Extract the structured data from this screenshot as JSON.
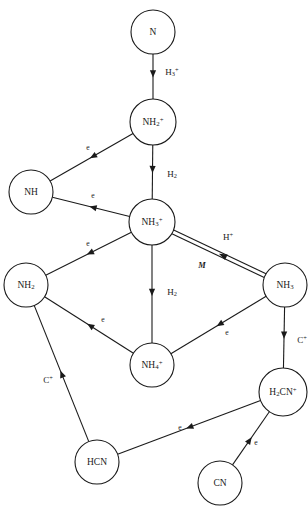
{
  "diagram": {
    "type": "reaction-network",
    "title": "",
    "nodes": [
      {
        "id": "N",
        "label": "N",
        "base": "N",
        "sub": "",
        "sup": "",
        "cx": 153,
        "cy": 32,
        "r": 22
      },
      {
        "id": "NH2p",
        "label": "NH2+",
        "base": "NH",
        "sub": "2",
        "sup": "+",
        "cx": 153,
        "cy": 122,
        "r": 23
      },
      {
        "id": "NH",
        "label": "NH",
        "base": "NH",
        "sub": "",
        "sup": "",
        "cx": 31,
        "cy": 192,
        "r": 22
      },
      {
        "id": "NH3p",
        "label": "NH3+",
        "base": "NH",
        "sub": "3",
        "sup": "+",
        "cx": 152,
        "cy": 222,
        "r": 23
      },
      {
        "id": "NH2",
        "label": "NH2",
        "base": "NH",
        "sub": "2",
        "sup": "",
        "cx": 26,
        "cy": 285,
        "r": 22
      },
      {
        "id": "NH3",
        "label": "NH3",
        "base": "NH",
        "sub": "3",
        "sup": "",
        "cx": 285,
        "cy": 285,
        "r": 22
      },
      {
        "id": "NH4p",
        "label": "NH4+",
        "base": "NH",
        "sub": "4",
        "sup": "+",
        "cx": 152,
        "cy": 365,
        "r": 22
      },
      {
        "id": "H2CNp",
        "label": "H2CN+",
        "base": "",
        "sub": "",
        "sup": "",
        "cx": 283,
        "cy": 392,
        "r": 24
      },
      {
        "id": "HCN",
        "label": "HCN",
        "base": "HCN",
        "sub": "",
        "sup": "",
        "cx": 97,
        "cy": 462,
        "r": 22
      },
      {
        "id": "CN",
        "label": "CN",
        "base": "CN",
        "sub": "",
        "sup": "",
        "cx": 220,
        "cy": 483,
        "r": 22
      }
    ],
    "edges": [
      {
        "id": "e1",
        "from": "N",
        "to": "NH2p",
        "label": "H3+",
        "base": "H",
        "sub": "3",
        "sup": "+",
        "style": "single",
        "lx": 172,
        "ly": 73
      },
      {
        "id": "e2",
        "from": "NH2p",
        "to": "NH",
        "label": "e",
        "base": "e",
        "sub": "",
        "sup": "",
        "style": "single",
        "lx": 88,
        "ly": 148
      },
      {
        "id": "e3",
        "from": "NH2p",
        "to": "NH3p",
        "label": "H2",
        "base": "H",
        "sub": "2",
        "sup": "",
        "style": "single",
        "lx": 172,
        "ly": 175
      },
      {
        "id": "e4",
        "from": "NH3p",
        "to": "NH",
        "label": "e",
        "base": "e",
        "sub": "",
        "sup": "",
        "style": "single",
        "lx": 93,
        "ly": 196
      },
      {
        "id": "e5",
        "from": "NH3p",
        "to": "NH2",
        "label": "e",
        "base": "e",
        "sub": "",
        "sup": "",
        "style": "single",
        "lx": 88,
        "ly": 244
      },
      {
        "id": "e6",
        "from": "NH3p",
        "to": "NH4p",
        "label": "H2",
        "base": "H",
        "sub": "2",
        "sup": "",
        "style": "single",
        "lx": 172,
        "ly": 293
      },
      {
        "id": "e7",
        "from": "NH3",
        "to": "NH3p",
        "label": "H+",
        "base": "H",
        "sub": "",
        "sup": "+",
        "style": "double",
        "lx": 228,
        "ly": 238
      },
      {
        "id": "e8",
        "from": "NH3",
        "to": "NH3p",
        "label": "M",
        "base": "M",
        "sub": "",
        "sup": "",
        "style": "catalyst",
        "lx": 202,
        "ly": 266
      },
      {
        "id": "e9",
        "from": "NH4p",
        "to": "NH2",
        "label": "e",
        "base": "e",
        "sub": "",
        "sup": "",
        "style": "single",
        "lx": 103,
        "ly": 320
      },
      {
        "id": "e10",
        "from": "NH3",
        "to": "NH4p",
        "label": "e",
        "base": "e",
        "sub": "",
        "sup": "",
        "style": "single",
        "lx": 227,
        "ly": 333
      },
      {
        "id": "e11",
        "from": "NH3",
        "to": "H2CNp",
        "label": "C+",
        "base": "C",
        "sub": "",
        "sup": "+",
        "style": "single",
        "lx": 302,
        "ly": 341
      },
      {
        "id": "e12",
        "from": "HCN",
        "to": "NH2",
        "label": "C+",
        "base": "C",
        "sub": "",
        "sup": "+",
        "style": "single",
        "lx": 48,
        "ly": 381
      },
      {
        "id": "e13",
        "from": "H2CNp",
        "to": "HCN",
        "label": "e",
        "base": "e",
        "sub": "",
        "sup": "",
        "style": "single",
        "lx": 180,
        "ly": 428
      },
      {
        "id": "e14",
        "from": "CN",
        "to": "H2CNp",
        "label": "e",
        "base": "e",
        "sub": "",
        "sup": "",
        "style": "single",
        "lx": 256,
        "ly": 443
      }
    ],
    "colors": {
      "stroke": "#1a1a1a",
      "node_fill": "#ffffff",
      "background": "#ffffff"
    }
  }
}
